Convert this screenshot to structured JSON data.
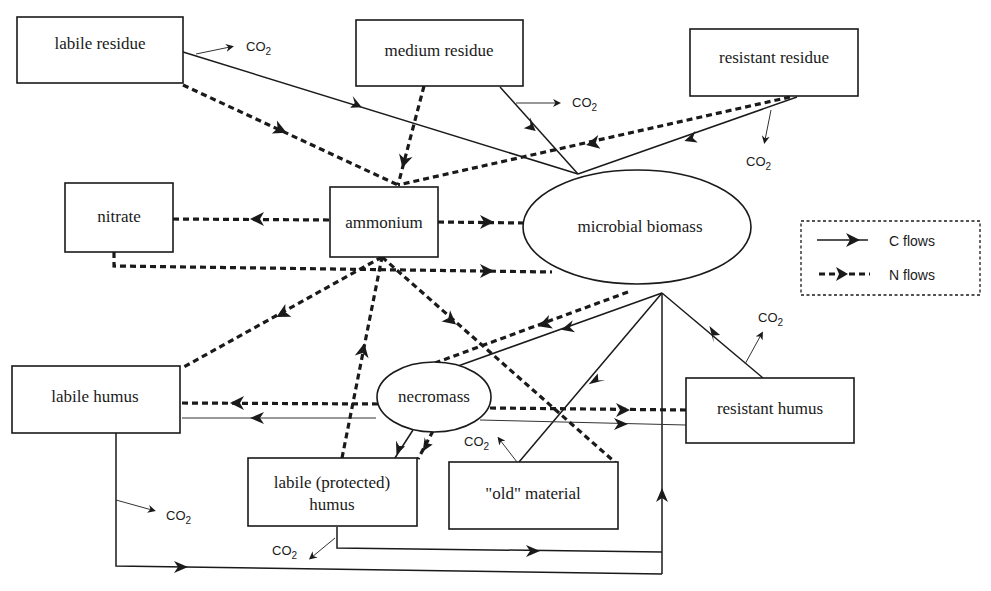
{
  "diagram": {
    "nodes": {
      "labile_residue": "labile residue",
      "medium_residue": "medium residue",
      "resistant_residue": "resistant residue",
      "nitrate": "nitrate",
      "ammonium": "ammonium",
      "microbial_biomass": "microbial biomass",
      "necromass": "necromass",
      "labile_humus": "labile humus",
      "resistant_humus": "resistant humus",
      "labile_protected_humus_line1": "labile (protected)",
      "labile_protected_humus_line2": "humus",
      "old_material": "\"old\" material"
    },
    "co2": {
      "base": "CO",
      "subscript": "2"
    },
    "legend": {
      "c_flows": "C flows",
      "n_flows": "N flows"
    },
    "flows": {
      "carbon": [
        {
          "from": "labile residue",
          "to": "microbial biomass"
        },
        {
          "from": "medium residue",
          "to": "microbial biomass"
        },
        {
          "from": "resistant residue",
          "to": "microbial biomass"
        },
        {
          "from": "resistant humus",
          "to": "microbial biomass"
        },
        {
          "from": "old material",
          "to": "microbial biomass"
        },
        {
          "from": "microbial biomass",
          "to": "necromass"
        },
        {
          "from": "necromass",
          "to": "labile humus"
        },
        {
          "from": "necromass",
          "to": "resistant humus"
        },
        {
          "from": "necromass",
          "to": "labile (protected) humus"
        },
        {
          "from": "labile humus",
          "to": "microbial biomass"
        },
        {
          "from": "labile (protected) humus",
          "to": "microbial biomass"
        }
      ],
      "nitrogen": [
        {
          "from": "labile residue",
          "to": "ammonium"
        },
        {
          "from": "medium residue",
          "to": "ammonium"
        },
        {
          "from": "resistant residue",
          "to": "ammonium"
        },
        {
          "from": "ammonium",
          "to": "nitrate"
        },
        {
          "from": "ammonium",
          "to": "microbial biomass"
        },
        {
          "from": "nitrate",
          "to": "microbial biomass"
        },
        {
          "from": "ammonium",
          "to": "labile humus"
        },
        {
          "from": "labile (protected) humus",
          "to": "ammonium"
        },
        {
          "from": "ammonium",
          "to": "old material"
        },
        {
          "from": "microbial biomass",
          "to": "necromass"
        },
        {
          "from": "necromass",
          "to": "labile humus"
        },
        {
          "from": "necromass",
          "to": "resistant humus"
        },
        {
          "from": "necromass",
          "to": "labile (protected) humus"
        }
      ]
    },
    "colors": {
      "ink": "#1a1a1a",
      "background": "#ffffff"
    }
  }
}
